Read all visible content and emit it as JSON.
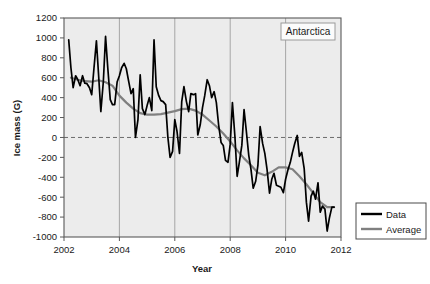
{
  "chart_data": {
    "type": "line",
    "title": "",
    "annotation": "Antarctica",
    "xlabel": "Year",
    "ylabel": "Ice mass (G)",
    "xlim": [
      2002,
      2012
    ],
    "ylim": [
      -1000,
      1200
    ],
    "xticks": [
      2002,
      2004,
      2006,
      2008,
      2010,
      2012
    ],
    "xtick_labels": [
      "2002",
      "2004",
      "2006",
      "2008",
      "2010",
      "2012"
    ],
    "yticks": [
      -1000,
      -800,
      -600,
      -400,
      -200,
      0,
      200,
      400,
      600,
      800,
      1000,
      1200
    ],
    "ytick_labels": [
      "-1000",
      "-800",
      "-600",
      "-400",
      "-200",
      "0",
      "200",
      "400",
      "600",
      "800",
      "1000",
      "1200"
    ],
    "grid": "vertical-only",
    "zero_line": 0,
    "zero_line_style": "dashed",
    "plot_background": "#ececec",
    "legend_position": "outside-right-bottom",
    "legend": [
      {
        "name": "Data",
        "color": "#000000",
        "width": 2.1
      },
      {
        "name": "Average",
        "color": "#808080",
        "width": 2.1
      }
    ],
    "series": [
      {
        "name": "Data",
        "color": "#000000",
        "x": [
          2002.17,
          2002.25,
          2002.33,
          2002.42,
          2002.5,
          2002.58,
          2002.67,
          2002.75,
          2002.83,
          2002.92,
          2003.0,
          2003.08,
          2003.17,
          2003.25,
          2003.33,
          2003.42,
          2003.5,
          2003.58,
          2003.67,
          2003.75,
          2003.83,
          2003.92,
          2004.0,
          2004.08,
          2004.17,
          2004.25,
          2004.33,
          2004.42,
          2004.5,
          2004.58,
          2004.67,
          2004.75,
          2004.83,
          2004.92,
          2005.0,
          2005.08,
          2005.17,
          2005.25,
          2005.33,
          2005.42,
          2005.5,
          2005.58,
          2005.67,
          2005.75,
          2005.83,
          2005.92,
          2006.0,
          2006.08,
          2006.17,
          2006.25,
          2006.33,
          2006.42,
          2006.5,
          2006.58,
          2006.67,
          2006.75,
          2006.83,
          2006.92,
          2007.0,
          2007.08,
          2007.17,
          2007.25,
          2007.33,
          2007.42,
          2007.5,
          2007.58,
          2007.67,
          2007.75,
          2007.83,
          2007.92,
          2008.0,
          2008.08,
          2008.17,
          2008.25,
          2008.33,
          2008.42,
          2008.5,
          2008.58,
          2008.67,
          2008.75,
          2008.83,
          2008.92,
          2009.0,
          2009.08,
          2009.17,
          2009.25,
          2009.33,
          2009.42,
          2009.5,
          2009.58,
          2009.67,
          2009.75,
          2009.83,
          2009.92,
          2010.0,
          2010.08,
          2010.17,
          2010.25,
          2010.33,
          2010.42,
          2010.5,
          2010.58,
          2010.67,
          2010.75,
          2010.83,
          2010.92,
          2011.0,
          2011.08,
          2011.17,
          2011.25,
          2011.33,
          2011.42,
          2011.5,
          2011.58,
          2011.67,
          2011.75
        ],
        "y": [
          980,
          700,
          500,
          620,
          580,
          520,
          620,
          545,
          540,
          500,
          430,
          690,
          970,
          620,
          260,
          560,
          1015,
          700,
          380,
          330,
          330,
          560,
          620,
          700,
          745,
          690,
          570,
          440,
          490,
          0,
          180,
          630,
          290,
          230,
          320,
          400,
          270,
          980,
          510,
          420,
          370,
          360,
          330,
          0,
          -200,
          -140,
          180,
          60,
          -160,
          360,
          510,
          360,
          260,
          440,
          430,
          440,
          25,
          130,
          300,
          420,
          580,
          520,
          400,
          460,
          350,
          130,
          -50,
          -80,
          -230,
          -250,
          -70,
          350,
          10,
          -390,
          -250,
          -80,
          280,
          70,
          -180,
          -320,
          -510,
          -440,
          -280,
          110,
          -60,
          -160,
          -320,
          -560,
          -420,
          -360,
          -480,
          -490,
          -500,
          -555,
          -420,
          -330,
          -250,
          -150,
          -60,
          20,
          -190,
          -150,
          -310,
          -650,
          -840,
          -590,
          -540,
          -620,
          -455,
          -750,
          -690,
          -720,
          -940,
          -810,
          -700,
          -700
        ]
      },
      {
        "name": "Average",
        "color": "#808080",
        "x": [
          2002.25,
          2002.5,
          2002.75,
          2003.0,
          2003.25,
          2003.5,
          2003.75,
          2004.0,
          2004.25,
          2004.5,
          2004.75,
          2005.0,
          2005.25,
          2005.5,
          2005.75,
          2006.0,
          2006.25,
          2006.5,
          2006.75,
          2007.0,
          2007.25,
          2007.5,
          2007.75,
          2008.0,
          2008.25,
          2008.5,
          2008.75,
          2009.0,
          2009.25,
          2009.5,
          2009.75,
          2010.0,
          2010.25,
          2010.5,
          2010.75,
          2011.0,
          2011.25,
          2011.5,
          2011.75
        ],
        "y": [
          600,
          580,
          565,
          560,
          575,
          555,
          520,
          420,
          350,
          290,
          245,
          230,
          230,
          235,
          250,
          265,
          285,
          290,
          270,
          230,
          170,
          110,
          40,
          -40,
          -130,
          -210,
          -280,
          -355,
          -380,
          -345,
          -300,
          -300,
          -320,
          -390,
          -470,
          -560,
          -650,
          -700,
          -700
        ]
      }
    ]
  },
  "annotation_box": {
    "label": "Antarctica"
  },
  "axes": {
    "y_title": "Ice mass (G)",
    "x_title": "Year"
  }
}
